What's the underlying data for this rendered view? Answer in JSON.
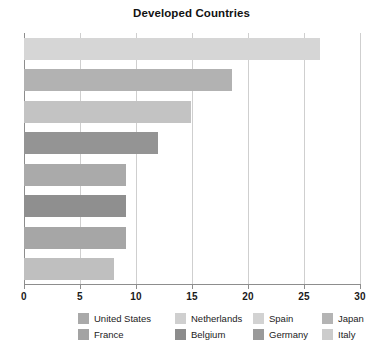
{
  "chart_data": {
    "type": "bar",
    "orientation": "horizontal",
    "title": "Developed Countries",
    "xlabel": "",
    "ylabel": "",
    "xlim": [
      0,
      30
    ],
    "ylim": null,
    "grid": true,
    "grid_axis": "x",
    "legend_position": "bottom",
    "categories": [
      "United States",
      "Netherlands",
      "Spain",
      "Japan",
      "France",
      "Belgium",
      "Germany",
      "Italy"
    ],
    "values": [
      26.4,
      18.6,
      14.9,
      12.0,
      9.1,
      9.1,
      9.1,
      8.0
    ],
    "xticks": [
      0,
      5,
      10,
      15,
      20,
      25,
      30
    ],
    "xtick_labels": [
      "0",
      "5",
      "10",
      "15",
      "20",
      "25",
      "30"
    ],
    "bar_colors": [
      "#d6d6d6",
      "#b2b2b2",
      "#c3c3c3",
      "#949494",
      "#aaaaaa",
      "#8f8f8f",
      "#a6a6a6",
      "#bfbfbf"
    ],
    "series": [
      {
        "name": "United States",
        "value": 26.4,
        "color": "#d6d6d6"
      },
      {
        "name": "Netherlands",
        "value": 18.6,
        "color": "#b2b2b2"
      },
      {
        "name": "Spain",
        "value": 14.9,
        "color": "#c3c3c3"
      },
      {
        "name": "Japan",
        "value": 12.0,
        "color": "#949494"
      },
      {
        "name": "France",
        "value": 9.1,
        "color": "#aaaaaa"
      },
      {
        "name": "Belgium",
        "value": 9.1,
        "color": "#8f8f8f"
      },
      {
        "name": "Germany",
        "value": 9.1,
        "color": "#a6a6a6"
      },
      {
        "name": "Italy",
        "value": 8.0,
        "color": "#bfbfbf"
      }
    ]
  },
  "legend": {
    "rows": [
      [
        {
          "label": "United States",
          "color": "#a9a9a9"
        },
        {
          "label": "Netherlands",
          "color": "#cfcfcf"
        },
        {
          "label": "Spain",
          "color": "#d2d2d2"
        },
        {
          "label": "Japan",
          "color": "#b4b4b4"
        }
      ],
      [
        {
          "label": "France",
          "color": "#a3a3a3"
        },
        {
          "label": "Belgium",
          "color": "#8c8c8c"
        },
        {
          "label": "Germany",
          "color": "#9a9a9a"
        },
        {
          "label": "Italy",
          "color": "#cccccc"
        }
      ]
    ]
  },
  "style": {
    "axis_color": "#8d8d8d",
    "grid_color": "#cfcfcf",
    "text_color": "#1a1a1a",
    "background": "#ffffff"
  }
}
